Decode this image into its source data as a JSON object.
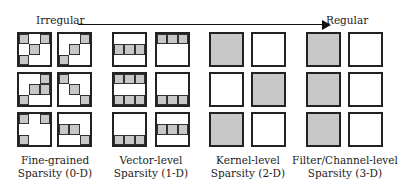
{
  "axis": {
    "left_label": "Irregular",
    "right_label": "Regular"
  },
  "groups": [
    {
      "name": "fine-grained",
      "caption_line1": "Fine-grained",
      "caption_line2": "Sparsity (0-D)",
      "kernels": [
        [
          [
            1,
            0,
            1
          ],
          [
            0,
            1,
            0
          ],
          [
            1,
            0,
            0
          ]
        ],
        [
          [
            0,
            0,
            1
          ],
          [
            0,
            1,
            0
          ],
          [
            1,
            0,
            0
          ]
        ],
        [
          [
            0,
            0,
            1
          ],
          [
            0,
            1,
            1
          ],
          [
            1,
            0,
            0
          ]
        ],
        [
          [
            1,
            0,
            0
          ],
          [
            0,
            1,
            0
          ],
          [
            0,
            0,
            1
          ]
        ],
        [
          [
            1,
            0,
            1
          ],
          [
            0,
            0,
            0
          ],
          [
            1,
            0,
            0
          ]
        ],
        [
          [
            0,
            0,
            0
          ],
          [
            1,
            1,
            0
          ],
          [
            0,
            0,
            1
          ]
        ]
      ]
    },
    {
      "name": "vector-level",
      "caption_line1": "Vector-level",
      "caption_line2": "Sparsity (1-D)",
      "kernels": [
        [
          [
            0,
            0,
            0
          ],
          [
            1,
            1,
            1
          ],
          [
            0,
            0,
            0
          ]
        ],
        [
          [
            1,
            1,
            1
          ],
          [
            0,
            0,
            0
          ],
          [
            0,
            0,
            0
          ]
        ],
        [
          [
            1,
            1,
            1
          ],
          [
            0,
            0,
            0
          ],
          [
            1,
            1,
            1
          ]
        ],
        [
          [
            0,
            0,
            0
          ],
          [
            0,
            0,
            0
          ],
          [
            1,
            1,
            1
          ]
        ],
        [
          [
            0,
            0,
            0
          ],
          [
            0,
            0,
            0
          ],
          [
            1,
            1,
            1
          ]
        ],
        [
          [
            0,
            0,
            0
          ],
          [
            1,
            1,
            1
          ],
          [
            0,
            0,
            0
          ]
        ]
      ]
    },
    {
      "name": "kernel-level",
      "caption_line1": "Kernel-level",
      "caption_line2": "Sparsity (2-D)",
      "kernels_full": [
        1,
        0,
        0,
        1,
        1,
        0
      ]
    },
    {
      "name": "filter-level",
      "caption_line1": "Filter/Channel-level",
      "caption_line2": "Sparsity (3-D)",
      "kernels_full": [
        1,
        0,
        1,
        0,
        1,
        0
      ]
    }
  ],
  "colors": {
    "shade": "#c8c8c8",
    "border": "#222222"
  }
}
